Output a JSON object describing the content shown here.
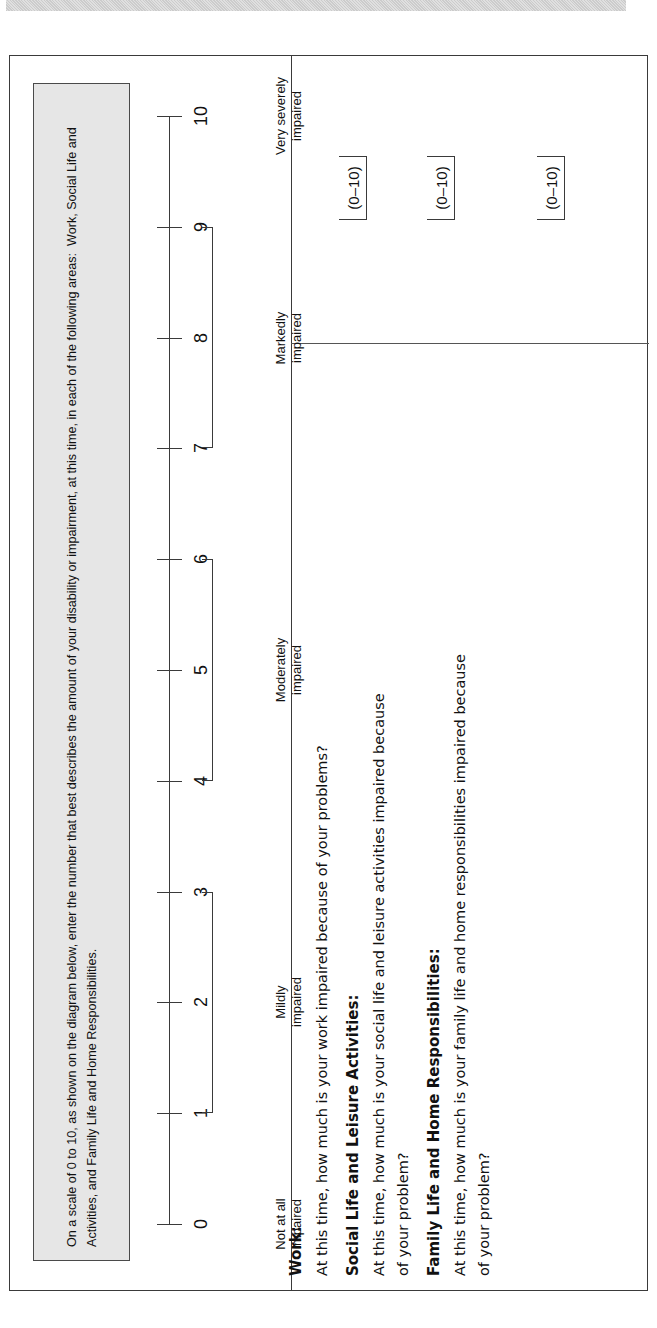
{
  "document": {
    "title": "Sheehan Disability Scale",
    "orientation": "rotated-90-ccw",
    "scan_bar_label": "scan-artifact-bar"
  },
  "instruction": {
    "text": "On a scale of 0 to 10, as shown on the diagram below, enter the number that best describes the amount of your disability or impairment, at this time, in each of the following areas:  Work, Social Life and Activities, and Family Life and Home Responsibilities."
  },
  "scale": {
    "min": 0,
    "max": 10,
    "ticks": [
      "0",
      "1",
      "2",
      "3",
      "4",
      "5",
      "6",
      "7",
      "8",
      "9",
      "10"
    ],
    "anchors": [
      {
        "name": "not-at-all-impaired",
        "label": "Not at all\nimpaired",
        "at": 0
      },
      {
        "name": "mildly-impaired",
        "label": "Mildly\nimpaired",
        "from": 1,
        "to": 3
      },
      {
        "name": "moderately-impaired",
        "label": "Moderately\nimpaired",
        "from": 4,
        "to": 6
      },
      {
        "name": "markedly-impaired",
        "label": "Markedly\nimpaired",
        "from": 7,
        "to": 9
      },
      {
        "name": "very-severely-impaired",
        "label": "Very severely\nimpaired",
        "at": 10
      }
    ]
  },
  "answers": {
    "range_label": "(0–10)",
    "slots": [
      {
        "name": "answer-work",
        "range": "(0–10)"
      },
      {
        "name": "answer-social-life",
        "range": "(0–10)"
      },
      {
        "name": "answer-family-life",
        "range": "(0–10)"
      }
    ]
  },
  "questions": [
    {
      "name": "work",
      "heading": "Work:",
      "lines": [
        "At this time, how much is your work impaired because of your problems?"
      ]
    },
    {
      "name": "social-life-and-leisure-activities",
      "heading": "Social Life and Leisure Activities:",
      "lines": [
        "At this time, how much is your social life and leisure activities impaired because",
        "of your problem?"
      ]
    },
    {
      "name": "family-life-and-home-responsibilities",
      "heading": "Family Life and Home Responsibilities:",
      "lines": [
        "At this time, how much is your family life and home responsibilities impaired because",
        "of your problem?"
      ]
    }
  ],
  "colors": {
    "instruction_box_fill": "#e6e6e6",
    "border": "#3a3a3a",
    "text": "#111111",
    "scan_bar": "#c9c9c9"
  }
}
